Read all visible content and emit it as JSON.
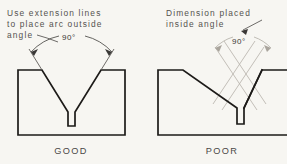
{
  "figure": {
    "width": 287,
    "height": 164,
    "background_color": "#f7f6f2",
    "line_color": "#1d1b19",
    "dimension_color": "#54524f",
    "faint_color": "#b9b5ae",
    "text_color": "#4a4846"
  },
  "good_example": {
    "note_line_1": "Use extension lines",
    "note_line_2": "to place arc outside",
    "note_line_3": "angle",
    "dimension_value": "90°",
    "caption": "GOOD"
  },
  "poor_example": {
    "note_line_1": "Dimension placed",
    "note_line_2": "inside angle",
    "dimension_value": "90°",
    "caption": "POOR"
  },
  "icons": {
    "leader_arrow": "arrow-head",
    "dimension_arrow": "arc-arrow-head"
  }
}
